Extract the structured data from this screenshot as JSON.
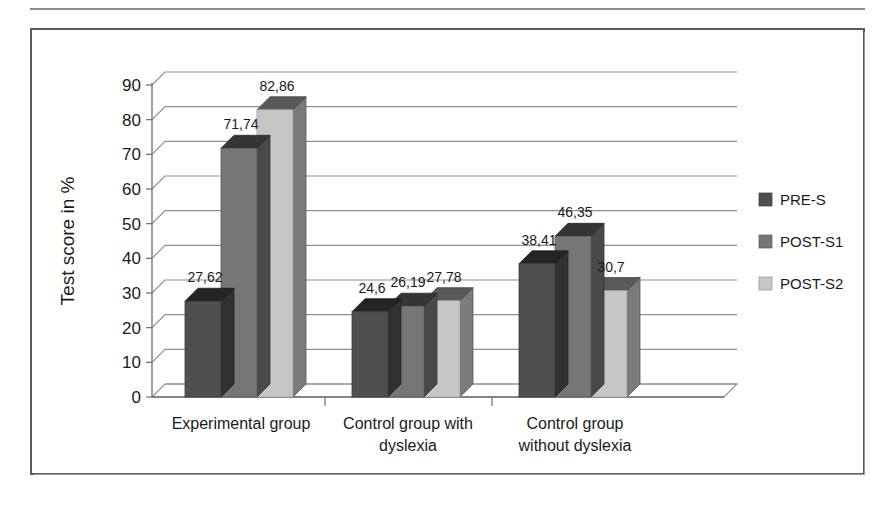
{
  "figure": {
    "frame_label": "bar-chart-figure"
  },
  "chart_data": {
    "type": "bar",
    "title": "",
    "subtitle": "",
    "xlabel": "",
    "ylabel": "Test score in %",
    "ylim": [
      0,
      90
    ],
    "ytick_step": 10,
    "ytick_labels": [
      "0",
      "10",
      "20",
      "30",
      "40",
      "50",
      "60",
      "70",
      "80",
      "90"
    ],
    "grid": true,
    "grid_axis": "y",
    "style": "3d-clustered-column",
    "legend_position": "right",
    "categories": [
      "Experimental group",
      "Control group with dyslexia",
      "Control group without dyslexia"
    ],
    "category_lines": [
      [
        "Experimental group"
      ],
      [
        "Control group with",
        "dyslexia"
      ],
      [
        "Control group",
        "without dyslexia"
      ]
    ],
    "series": [
      {
        "name": "PRE-S",
        "color": "#4f4f4f",
        "values": [
          27.62,
          24.6,
          38.41
        ],
        "value_labels": [
          "27,62",
          "24,6",
          "38,41"
        ]
      },
      {
        "name": "POST-S1",
        "color": "#767676",
        "values": [
          71.74,
          26.19,
          46.35
        ],
        "value_labels": [
          "71,74",
          "26,19",
          "46,35"
        ]
      },
      {
        "name": "POST-S2",
        "color": "#c6c6c6",
        "values": [
          82.86,
          27.78,
          30.7
        ],
        "value_labels": [
          "82,86",
          "27,78",
          "30,7"
        ]
      }
    ]
  }
}
